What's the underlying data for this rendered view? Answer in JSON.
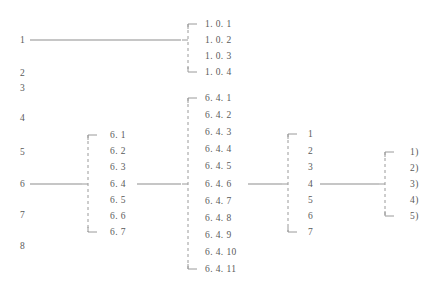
{
  "diagram": {
    "line_color": "#8d8d8d",
    "bracket_color": "#9a9a9a",
    "background": "#ffffff",
    "columns": [
      {
        "id": "level1",
        "name": "level-1-items",
        "text_x": 20,
        "items": [
          {
            "label": "1",
            "y": 40,
            "has_connector": true
          },
          {
            "label": "2",
            "y": 73,
            "has_connector": false
          },
          {
            "label": "3",
            "y": 88,
            "has_connector": false
          },
          {
            "label": "4",
            "y": 118,
            "has_connector": false
          },
          {
            "label": "5",
            "y": 152,
            "has_connector": false
          },
          {
            "label": "6",
            "y": 184,
            "has_connector": true
          },
          {
            "label": "7",
            "y": 215,
            "has_connector": false
          },
          {
            "label": "8",
            "y": 246,
            "has_connector": false
          }
        ]
      },
      {
        "id": "level2-6",
        "name": "level-2-items-of-6",
        "bracket_x": 88,
        "text_x": 110,
        "stub_from": 32,
        "parent_y": 184,
        "items": [
          {
            "label": "6. 1",
            "y": 135
          },
          {
            "label": "6. 2",
            "y": 151
          },
          {
            "label": "6. 3",
            "y": 167
          },
          {
            "label": "6. 4",
            "y": 184
          },
          {
            "label": "6. 5",
            "y": 200
          },
          {
            "label": "6. 6",
            "y": 216
          },
          {
            "label": "6. 7",
            "y": 232
          }
        ]
      },
      {
        "id": "level3-64",
        "name": "level-3-items-of-6-4",
        "bracket_x": 188,
        "text_x": 205,
        "parent_y": 184,
        "items": [
          {
            "label": "6. 4. 1",
            "y": 98
          },
          {
            "label": "6. 4. 2",
            "y": 115
          },
          {
            "label": "6. 4. 3",
            "y": 132
          },
          {
            "label": "6. 4. 4",
            "y": 149
          },
          {
            "label": "6. 4. 5",
            "y": 166
          },
          {
            "label": "6. 4. 6",
            "y": 184
          },
          {
            "label": "6. 4. 7",
            "y": 201
          },
          {
            "label": "6. 4. 8",
            "y": 218
          },
          {
            "label": "6. 4. 9",
            "y": 235
          },
          {
            "label": "6. 4. 10",
            "y": 252
          },
          {
            "label": "6. 4. 11",
            "y": 269
          }
        ]
      },
      {
        "id": "level1-top",
        "name": "level-2-items-of-1",
        "bracket_x": 188,
        "text_x": 205,
        "parent_y": 40,
        "items": [
          {
            "label": "1. 0. 1",
            "y": 24
          },
          {
            "label": "1. 0. 2",
            "y": 40
          },
          {
            "label": "1. 0. 3",
            "y": 56
          },
          {
            "label": "1. 0. 4",
            "y": 72
          }
        ]
      },
      {
        "id": "level4",
        "name": "level-4-items",
        "bracket_x": 288,
        "text_x": 308,
        "parent_y": 184,
        "items": [
          {
            "label": "1",
            "y": 134
          },
          {
            "label": "2",
            "y": 151
          },
          {
            "label": "3",
            "y": 167
          },
          {
            "label": "4",
            "y": 184
          },
          {
            "label": "5",
            "y": 200
          },
          {
            "label": "6",
            "y": 216
          },
          {
            "label": "7",
            "y": 232
          }
        ]
      },
      {
        "id": "level5",
        "name": "level-5-items",
        "bracket_x": 385,
        "text_x": 410,
        "parent_y": 184,
        "items": [
          {
            "label": "1)",
            "y": 152
          },
          {
            "label": "2)",
            "y": 168
          },
          {
            "label": "3)",
            "y": 184
          },
          {
            "label": "4)",
            "y": 200
          },
          {
            "label": "5)",
            "y": 216
          }
        ]
      }
    ],
    "connectors": [
      {
        "name": "connector-1-to-1.0.x",
        "x1": 30,
        "y1": 40,
        "x2": 181,
        "y2": 40
      },
      {
        "name": "connector-6-to-6.x",
        "x1": 30,
        "y1": 184,
        "x2": 82,
        "y2": 184
      },
      {
        "name": "connector-6.4-to-6.4.x",
        "x1": 137,
        "y1": 184,
        "x2": 181,
        "y2": 184
      },
      {
        "name": "connector-6.4.6-to-level4",
        "x1": 248,
        "y1": 184,
        "x2": 282,
        "y2": 184
      },
      {
        "name": "connector-level4-4-to-level5",
        "x1": 320,
        "y1": 184,
        "x2": 379,
        "y2": 184
      }
    ]
  }
}
